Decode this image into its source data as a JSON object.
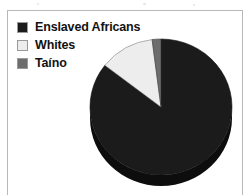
{
  "figure": {
    "background_color": "#ffffff",
    "border_color": "#b8b8b8"
  },
  "legend": {
    "items": [
      {
        "label": "Enslaved Africans",
        "color": "#1b1b1b",
        "swatch_name": "legend-swatch-enslaved-africans"
      },
      {
        "label": "Whites",
        "color": "#ededed",
        "swatch_name": "legend-swatch-whites"
      },
      {
        "label": "Taíno",
        "color": "#6d6d6d",
        "swatch_name": "legend-swatch-taino"
      }
    ]
  },
  "chart_data": {
    "type": "pie",
    "title": "",
    "categories": [
      "Enslaved Africans",
      "Whites",
      "Taíno"
    ],
    "values": [
      85.5,
      12.5,
      2.0
    ],
    "colors": [
      "#1b1b1b",
      "#ededed",
      "#6d6d6d"
    ],
    "units": "percent",
    "start_angle": 0,
    "direction": "clockwise",
    "three_d": true,
    "depth_color": "#0d0d0d",
    "legend_position": "top-left",
    "grid": false,
    "labels_shown": false
  }
}
